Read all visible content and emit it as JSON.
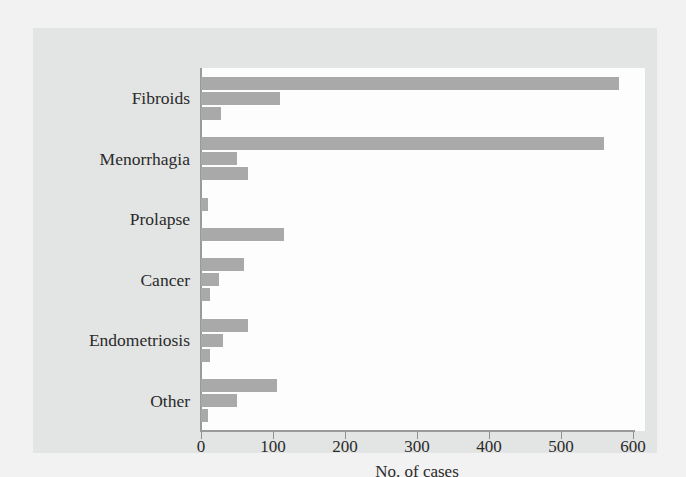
{
  "chart_data": {
    "type": "bar",
    "orientation": "horizontal",
    "title": "",
    "subtitle": "",
    "xlabel": "No. of cases",
    "ylabel": "",
    "categories": [
      "Fibroids",
      "Menorrhagia",
      "Prolapse",
      "Cancer",
      "Endometriosis",
      "Other"
    ],
    "series": [
      {
        "name": "Series 1",
        "values": [
          580,
          560,
          10,
          60,
          65,
          105
        ]
      },
      {
        "name": "Series 2",
        "values": [
          110,
          50,
          0,
          25,
          30,
          50
        ]
      },
      {
        "name": "Series 3",
        "values": [
          28,
          65,
          115,
          12,
          12,
          10
        ]
      }
    ],
    "xlim": [
      0,
      600
    ],
    "xticks": [
      0,
      100,
      200,
      300,
      400,
      500,
      600
    ],
    "xtick_labels": [
      "0",
      "100",
      "200",
      "300",
      "400",
      "500",
      "600"
    ],
    "grid": false,
    "legend": "none",
    "bar_color": "#a9a9a9",
    "axis_color": "#9a9a9a",
    "text_color": "#2a2a2a",
    "plot_background": "#fdfdfd",
    "figure_background": "#e3e4e4",
    "page_background": "#f2f2f2",
    "annotations": []
  }
}
